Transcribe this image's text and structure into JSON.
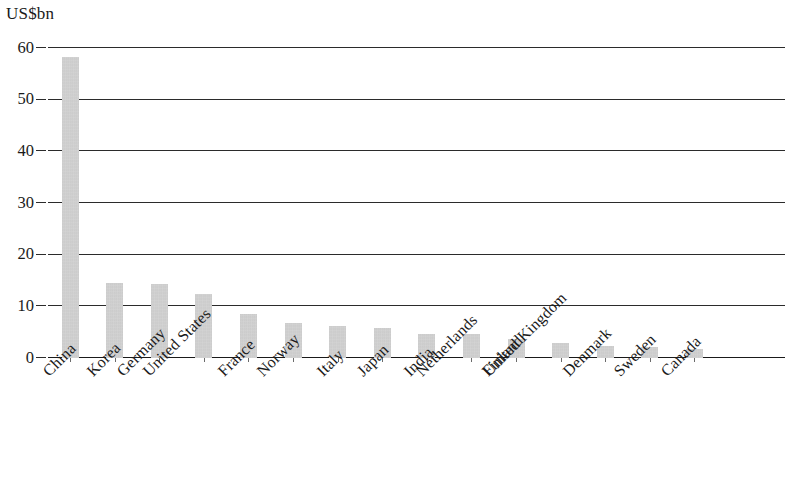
{
  "chart_data": {
    "type": "bar",
    "title": "",
    "subtitle": "",
    "xlabel": "",
    "ylabel": "US$bn",
    "ylim": [
      0,
      60
    ],
    "yticks": [
      0,
      10,
      20,
      30,
      40,
      50,
      60
    ],
    "ytick_labels": [
      "0",
      "10",
      "20",
      "30",
      "40",
      "50",
      "60"
    ],
    "grid": true,
    "legend": false,
    "legend_position": "none",
    "orientation": "vertical",
    "bar_color": "#c6c6c6",
    "axis_color": "#1a1a1a",
    "categories": [
      "China",
      "Korea",
      "Germany",
      "United States",
      "France",
      "Norway",
      "Italy",
      "Japan",
      "India",
      "Netherlands",
      "Finland",
      "United Kingdom",
      "Denmark",
      "Sweden",
      "Canada"
    ],
    "values": [
      58.3,
      14.5,
      14.3,
      12.3,
      8.5,
      6.8,
      6.1,
      5.8,
      4.7,
      4.6,
      3.6,
      3.0,
      2.4,
      2.1,
      1.7
    ]
  }
}
